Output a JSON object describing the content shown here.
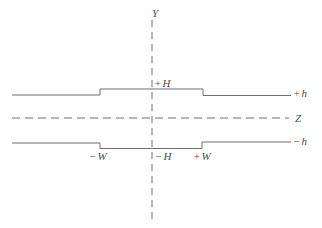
{
  "figure": {
    "background": "#ffffff",
    "line_color": "#6e6e6e",
    "text_color": "#4d4d4d",
    "width": 322,
    "height": 228
  },
  "axes": {
    "y_axis": {
      "label": "Y",
      "x": 152,
      "y1": 20,
      "y2": 219,
      "dash": "7,5",
      "label_x": 152,
      "label_y": 17
    },
    "z_axis": {
      "label": "Z",
      "y": 118,
      "x1": 12,
      "x2": 289,
      "dash": "8,5",
      "label_x": 295,
      "label_y": 122
    }
  },
  "conductors": {
    "top": {
      "name": "upper-conductor-with-ridge",
      "points": [
        [
          12,
          95
        ],
        [
          100,
          95
        ],
        [
          100,
          89
        ],
        [
          203,
          89
        ],
        [
          203,
          95.5
        ],
        [
          291,
          95.5
        ]
      ]
    },
    "bottom": {
      "name": "lower-conductor-with-groove",
      "points": [
        [
          12,
          143
        ],
        [
          100,
          143
        ],
        [
          100,
          148.5
        ],
        [
          202,
          148.5
        ],
        [
          202,
          142
        ],
        [
          291,
          142
        ]
      ]
    }
  },
  "labels": [
    {
      "id": "y-axis",
      "text": "Y",
      "x": 152,
      "y": 17
    },
    {
      "id": "z-axis",
      "text": "Z",
      "x": 295,
      "y": 122
    },
    {
      "id": "plus-H",
      "text": "+H",
      "x": 154,
      "y": 87
    },
    {
      "id": "plus-h",
      "text": "+h",
      "x": 293,
      "y": 97
    },
    {
      "id": "minus-h",
      "text": "−h",
      "x": 293,
      "y": 145
    },
    {
      "id": "minus-W",
      "text": "−W",
      "x": 89,
      "y": 160
    },
    {
      "id": "minus-H",
      "text": "−H",
      "x": 155,
      "y": 160
    },
    {
      "id": "plus-W",
      "text": "+W",
      "x": 193,
      "y": 160
    }
  ]
}
